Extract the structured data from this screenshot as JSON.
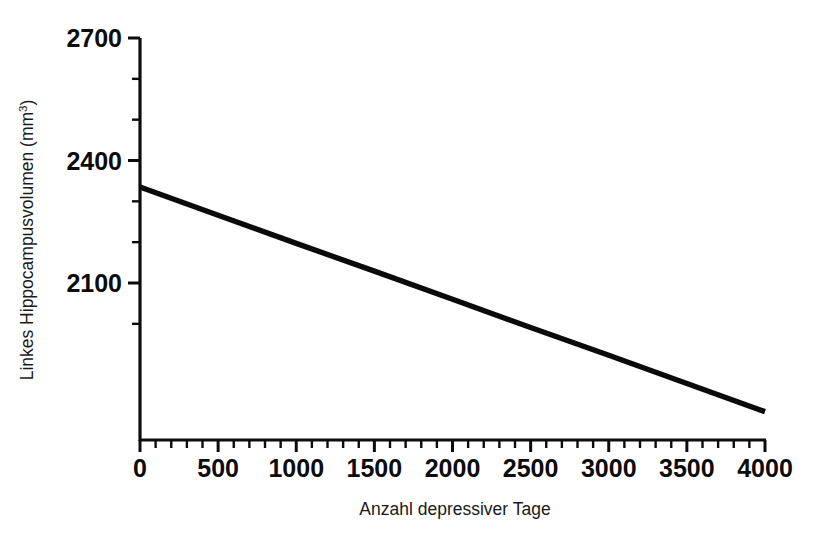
{
  "chart_data": {
    "type": "line",
    "title": "",
    "subtitle": "",
    "xlabel": "Anzahl depressiver Tage",
    "ylabel": "Linkes Hippocampusvolumen (mm³)",
    "ylabel_base": "Linkes Hippocampusvolumen (mm",
    "ylabel_sup": "3",
    "ylabel_tail": ")",
    "xlim": [
      0,
      4000
    ],
    "ylim": [
      1950,
      2700
    ],
    "xticks": [
      0,
      500,
      1000,
      1500,
      2000,
      2500,
      3000,
      3500,
      4000
    ],
    "xticklabels": [
      "0",
      "500",
      "1000",
      "1500",
      "2000",
      "2500",
      "3000",
      "3500",
      "4000"
    ],
    "xtick_minor_step": 100,
    "yticks": [
      2100,
      2400,
      2700
    ],
    "yticklabels": [
      "2100",
      "2400",
      "2700"
    ],
    "ytick_minor_step": 100,
    "grid": false,
    "legend": null,
    "series": [
      {
        "name": "Regressionsgerade",
        "color": "#0a0a0a",
        "linewidth": 5.4,
        "x": [
          0,
          500,
          1000,
          1500,
          2000,
          2500,
          3000,
          3500,
          4000
        ],
        "values": [
          2335,
          2266,
          2197,
          2129,
          2060,
          1991,
          1923,
          1854,
          1785
        ]
      }
    ],
    "annotations": []
  },
  "axis": {
    "x_tick_labels": [
      "0",
      "500",
      "1000",
      "1500",
      "2000",
      "2500",
      "3000",
      "3500",
      "4000"
    ],
    "y_tick_labels": [
      "2700",
      "2400",
      "2100"
    ]
  }
}
